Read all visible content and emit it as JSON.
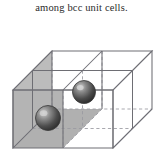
{
  "caption": {
    "text": "among bcc unit cells."
  },
  "figure": {
    "name": "bcc-unit-cells-diagram",
    "cell_count_x": 2,
    "cell_count_y": 2,
    "cell_count_z": 1,
    "projection": "oblique",
    "colors": {
      "edge_solid": "#6e6e74",
      "edge_hidden": "#9b9ba2",
      "face_shaded": "#b6b6b6",
      "face_shaded_dark": "#a9a9a9",
      "sphere_dark": "#3a3a3a",
      "sphere_mid": "#6d6d6d",
      "sphere_light": "#c9c9c9",
      "background": "#ffffff",
      "caption_text": "#2b2b2b"
    },
    "atoms": [
      {
        "label": "atom-front-center",
        "cx": 48,
        "cy": 104,
        "r": 12.5
      },
      {
        "label": "atom-back-center",
        "cx": 84,
        "cy": 78,
        "r": 11.5
      }
    ],
    "geometry": {
      "front_bottom_left": [
        13,
        134
      ],
      "front_top_left": [
        13,
        76
      ],
      "front_bottom_right": [
        113,
        134
      ],
      "front_top_right": [
        113,
        76
      ],
      "depth_offset": [
        39,
        -39
      ]
    }
  }
}
